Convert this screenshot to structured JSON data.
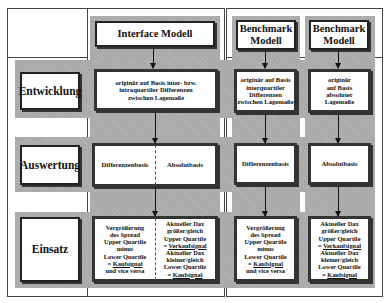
{
  "rows": {
    "entwicklung": "Entwicklung",
    "auswertung": "Auswertung",
    "einsatz": "Einsatz"
  },
  "columns": {
    "interface": {
      "header": "Interface Modell",
      "entwicklung": [
        "originär auf Basis inter- bzw.",
        "intraquartiler Differenzen",
        "zwischen Lagemaße"
      ],
      "auswertung_left": "Differenzenbasis",
      "auswertung_right": "Absolutbasis",
      "einsatz_left": {
        "l1": "Vergrößerung",
        "l2": "des Spread",
        "l3": "Upper Quartile",
        "l4": "minus",
        "l5": "Lower Quartile",
        "l6_prefix": "= ",
        "l6_signal": "Kaufsignal",
        "l7": "und vice versa"
      },
      "einsatz_right": {
        "l1": "Aktueller Dax",
        "l2": "größer/gleich",
        "l3": "Upper Quartile",
        "l4_prefix": "= ",
        "l4_signal": "Verkaufsignal",
        "l5": "Aktueller Dax",
        "l6": "kleiner/gleich",
        "l7": "Lower Quartile",
        "l8_prefix": "= ",
        "l8_signal": "Kaufsignal"
      }
    },
    "benchmark1": {
      "header_l1": "Benchmark",
      "header_l2": "Modell",
      "entwicklung": [
        "originär auf Basis",
        "interquartiler",
        "Differenzen",
        "zwischen Lagemaße"
      ],
      "auswertung": "Differenzenbasis",
      "einsatz": {
        "l1": "Vergrößerung",
        "l2": "des Spread",
        "l3": "Upper Quartile",
        "l4": "minus",
        "l5": "Lower Quartile",
        "l6_prefix": "= ",
        "l6_signal": "Kaufsignal",
        "l7": "und vice versa"
      }
    },
    "benchmark2": {
      "header_l1": "Benchmark",
      "header_l2": "Modell",
      "entwicklung": [
        "originär",
        "auf Basis",
        "absoluter",
        "Lagemaße"
      ],
      "auswertung": "Absolutbasis",
      "einsatz": {
        "l1": "Aktueller Dax",
        "l2": "größer/gleich",
        "l3": "Upper Quartile",
        "l4_prefix": "= ",
        "l4_signal": "Verkaufsignal",
        "l5": "Aktueller Dax",
        "l6": "kleiner/gleich",
        "l7": "Lower Quartile",
        "l8_prefix": "= ",
        "l8_signal": "Kaufsignal"
      }
    }
  },
  "colors": {
    "band": "#a9a9a9",
    "line": "#444444",
    "box": "#ffffff"
  }
}
